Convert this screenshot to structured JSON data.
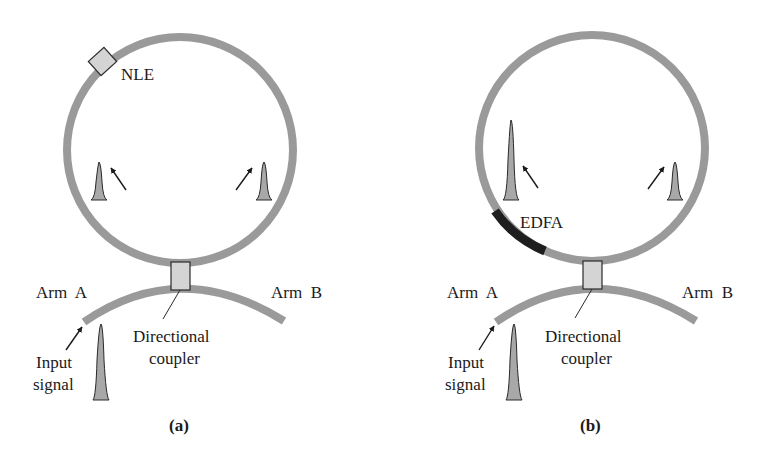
{
  "figure": {
    "colors": {
      "fiber": "#9a9a9a",
      "edfa": "#1e1e1e",
      "component_fill": "#d4d4d4",
      "pulse_fill": "#a8a8a8",
      "outline": "#2a2a2a",
      "arrow": "#1a1a1a"
    },
    "panels": [
      {
        "id": "a",
        "caption": "(a)",
        "labels": {
          "element": "NLE",
          "arm_a": "Arm  A",
          "arm_b": "Arm  B",
          "coupler_line1": "Directional",
          "coupler_line2": "coupler",
          "input_line1": "Input",
          "input_line2": "signal"
        },
        "components": [
          "nonlinear element (NLE)",
          "directional coupler",
          "fiber loop",
          "input pulse",
          "counter-propagating pulses (equal amplitude)"
        ]
      },
      {
        "id": "b",
        "caption": "(b)",
        "labels": {
          "element": "EDFA",
          "arm_a": "Arm  A",
          "arm_b": "Arm  B",
          "coupler_line1": "Directional",
          "coupler_line2": "coupler",
          "input_line1": "Input",
          "input_line2": "signal"
        },
        "components": [
          "erbium-doped fiber amplifier (EDFA)",
          "directional coupler",
          "fiber loop",
          "input pulse",
          "counter-propagating pulses (amplified vs. unamplified)"
        ]
      }
    ]
  }
}
